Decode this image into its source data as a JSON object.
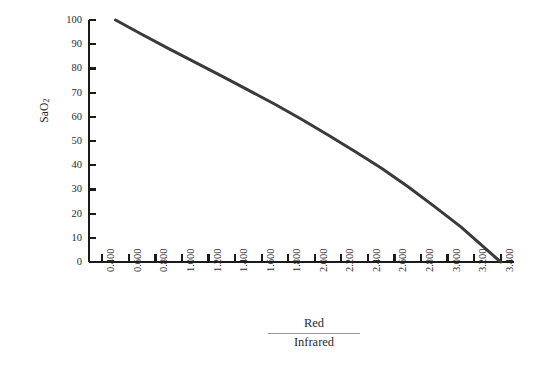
{
  "chart_data": {
    "type": "line",
    "title": "",
    "subtitle": "",
    "xlabel_numerator": "Red",
    "xlabel_denominator": "Infrared",
    "ylabel": "SaO",
    "ylabel_subscript": "2",
    "xlim": [
      0.3,
      3.5
    ],
    "ylim": [
      0,
      100
    ],
    "grid": false,
    "legend": "none",
    "x_tick_labels": [
      "0.400",
      "0.600",
      "0.800",
      "1.000",
      "1.200",
      "1.400",
      "1.600",
      "1.800",
      "2.000",
      "2.200",
      "2.400",
      "2.600",
      "2.800",
      "3.000",
      "3.200",
      "3.400"
    ],
    "x_tick_values": [
      0.4,
      0.6,
      0.8,
      1.0,
      1.2,
      1.4,
      1.6,
      1.8,
      2.0,
      2.2,
      2.4,
      2.6,
      2.8,
      3.0,
      3.2,
      3.4
    ],
    "y_tick_labels": [
      "100",
      "90",
      "80",
      "70",
      "60",
      "50",
      "40",
      "30",
      "20",
      "10",
      "0"
    ],
    "y_tick_values": [
      100,
      90,
      80,
      70,
      60,
      50,
      40,
      30,
      20,
      10,
      0
    ],
    "series": [
      {
        "name": "Calibration curve",
        "color": "#3a3a3a",
        "width": 3,
        "x": [
          0.5,
          0.7,
          0.9,
          1.1,
          1.3,
          1.5,
          1.7,
          1.9,
          2.1,
          2.3,
          2.5,
          2.7,
          2.9,
          3.1,
          3.4
        ],
        "y": [
          100.0,
          94.0,
          88.2,
          82.5,
          76.8,
          71.0,
          65.2,
          59.0,
          52.5,
          45.8,
          38.8,
          31.2,
          23.0,
          14.5,
          0.0
        ]
      }
    ],
    "axis_color": "#1a1a1a",
    "text_color": "#2b2b2b",
    "background": "#ffffff"
  },
  "geometry": {
    "plot_left": 89,
    "plot_right": 514,
    "plot_top": 20,
    "plot_bottom": 262
  }
}
